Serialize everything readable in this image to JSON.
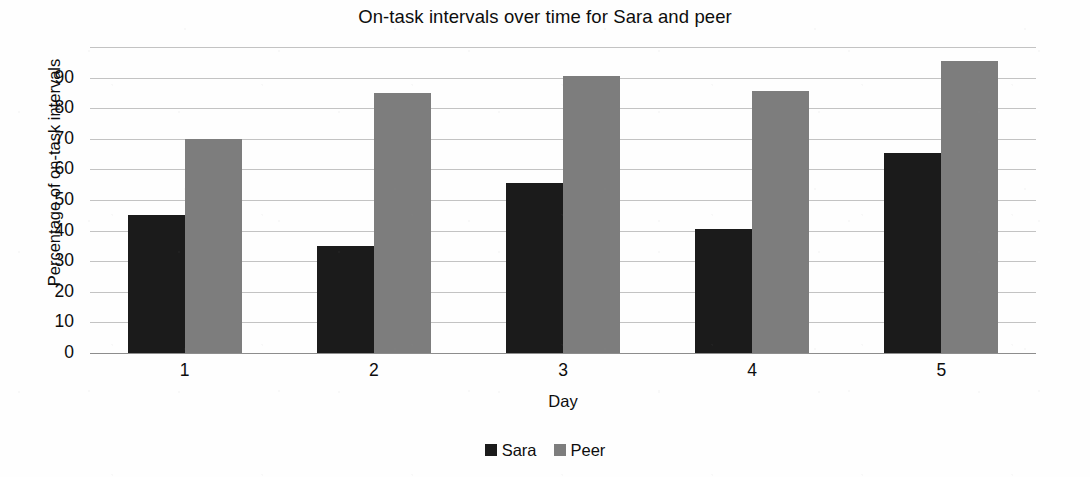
{
  "chart_data": {
    "type": "bar",
    "title": "On-task intervals over time for Sara and peer",
    "xlabel": "Day",
    "ylabel": "Percentage of on-task intervals",
    "categories": [
      "1",
      "2",
      "3",
      "4",
      "5"
    ],
    "series": [
      {
        "name": "Sara",
        "color": "#1b1b1b",
        "values": [
          45,
          35,
          55.5,
          40.5,
          65.5
        ]
      },
      {
        "name": "Peer",
        "color": "#7d7d7d",
        "values": [
          70,
          85,
          90.5,
          85.5,
          95.5
        ]
      }
    ],
    "ylim": [
      0,
      100
    ],
    "ytick_labels": [
      "0",
      "10",
      "20",
      "30",
      "40",
      "50",
      "60",
      "70",
      "80",
      "90"
    ],
    "ytick_values": [
      0,
      10,
      20,
      30,
      40,
      50,
      60,
      70,
      80,
      90
    ],
    "gridline_values": [
      0,
      10,
      20,
      30,
      40,
      50,
      60,
      70,
      80,
      90,
      100
    ],
    "grid": true,
    "legend_position": "bottom",
    "legend_entries": [
      "Sara",
      "Peer"
    ]
  },
  "colors": {
    "sara_bar": "#1b1b1b",
    "peer_bar": "#7d7d7d",
    "gridline": "#b9b9b9",
    "text": "#0d0d0d",
    "background": "#fefefe"
  }
}
